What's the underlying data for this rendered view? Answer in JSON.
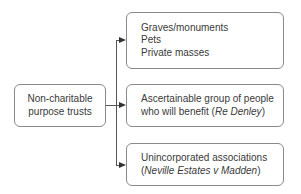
{
  "diagram": {
    "root": {
      "lines": [
        "Non-charitable",
        "purpose trusts"
      ]
    },
    "branches": [
      {
        "lines": [
          "Graves/monuments",
          "Pets",
          "Private masses"
        ]
      },
      {
        "line1": "Ascertainable group of people",
        "line2_prefix": "who will benefit (",
        "line2_case": "Re Denley",
        "line2_suffix": ")"
      },
      {
        "line1": "Unincorporated associations",
        "line2_prefix": "(",
        "line2_case": "Neville Estates v Madden",
        "line2_suffix": ")"
      }
    ]
  },
  "colors": {
    "border": "#8a8a8a",
    "line": "#555555",
    "text": "#3a3a3a"
  }
}
